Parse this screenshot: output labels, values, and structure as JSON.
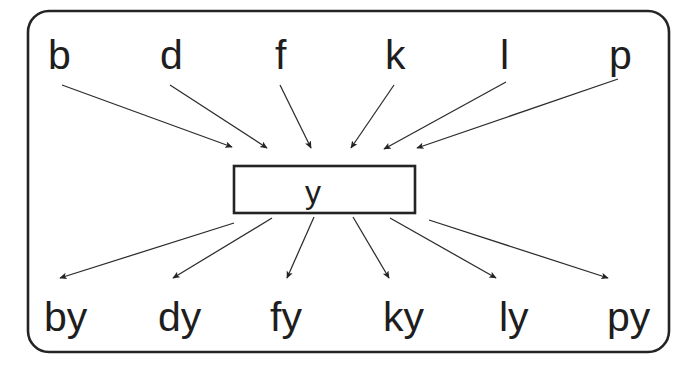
{
  "diagram": {
    "type": "word-matrix",
    "frame": {
      "stroke_color": "#242424",
      "fill_color": "#ffffff",
      "corner_radius": 20
    },
    "base": {
      "text": "y",
      "box_stroke_color": "#242424",
      "box_fill_color": "#ffffff"
    },
    "prefixes": [
      {
        "id": "b",
        "label": "b",
        "x": 50,
        "y": 70
      },
      {
        "id": "d",
        "label": "d",
        "x": 162,
        "y": 70
      },
      {
        "id": "f",
        "label": "f",
        "x": 276,
        "y": 70
      },
      {
        "id": "k",
        "label": "k",
        "x": 386,
        "y": 70
      },
      {
        "id": "l",
        "label": "l",
        "x": 500,
        "y": 70
      },
      {
        "id": "p",
        "label": "p",
        "x": 610,
        "y": 70
      }
    ],
    "results": [
      {
        "id": "by",
        "label": "by",
        "x": 45,
        "y": 332
      },
      {
        "id": "dy",
        "label": "dy",
        "x": 159,
        "y": 332
      },
      {
        "id": "fy",
        "label": "fy",
        "x": 271,
        "y": 332
      },
      {
        "id": "ky",
        "label": "ky",
        "x": 384,
        "y": 332
      },
      {
        "id": "ly",
        "label": "ly",
        "x": 500,
        "y": 332
      },
      {
        "id": "py",
        "label": "py",
        "x": 608,
        "y": 332
      }
    ],
    "incoming_arrows": [
      {
        "from": "b",
        "x1": 62,
        "y1": 85,
        "x2": 234,
        "y2": 148
      },
      {
        "from": "d",
        "x1": 170,
        "y1": 85,
        "x2": 269,
        "y2": 149
      },
      {
        "from": "f",
        "x1": 280,
        "y1": 85,
        "x2": 312,
        "y2": 149
      },
      {
        "from": "k",
        "x1": 394,
        "y1": 85,
        "x2": 350,
        "y2": 149
      },
      {
        "from": "l",
        "x1": 505,
        "y1": 83,
        "x2": 383,
        "y2": 150
      },
      {
        "from": "p",
        "x1": 617,
        "y1": 80,
        "x2": 416,
        "y2": 149
      }
    ],
    "outgoing_arrows": [
      {
        "to": "by",
        "x1": 233,
        "y1": 223,
        "x2": 59,
        "y2": 278
      },
      {
        "to": "dy",
        "x1": 272,
        "y1": 218,
        "x2": 172,
        "y2": 278
      },
      {
        "to": "fy",
        "x1": 313,
        "y1": 217,
        "x2": 286,
        "y2": 278
      },
      {
        "to": "ky",
        "x1": 353,
        "y1": 217,
        "x2": 389,
        "y2": 278
      },
      {
        "to": "ly",
        "x1": 390,
        "y1": 218,
        "x2": 496,
        "y2": 278
      },
      {
        "to": "py",
        "x1": 428,
        "y1": 220,
        "x2": 608,
        "y2": 278
      }
    ]
  }
}
